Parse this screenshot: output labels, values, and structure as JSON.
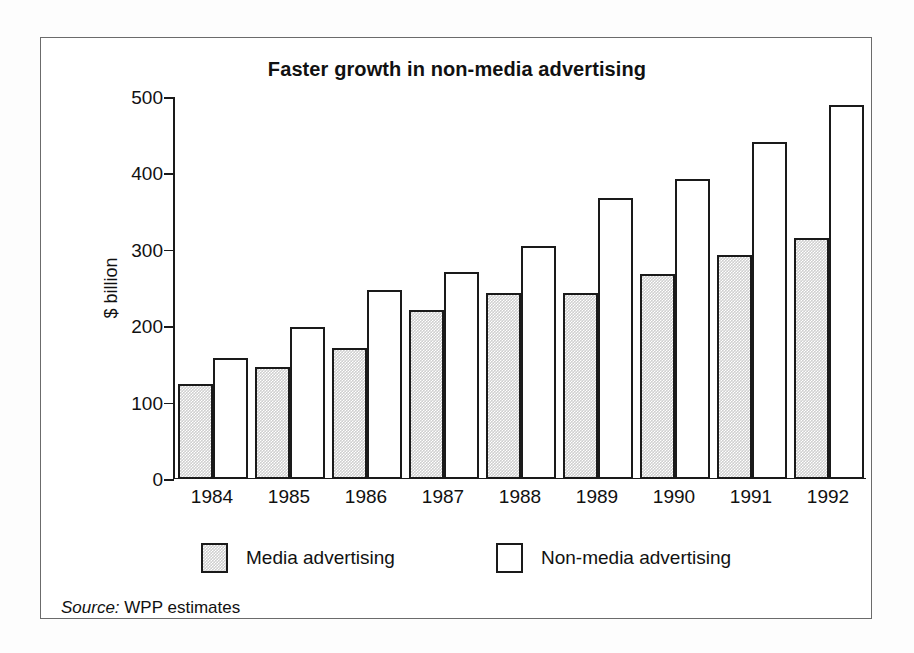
{
  "figure": {
    "title": "Faster growth in non-media advertising",
    "source_prefix": "Source:",
    "source_text": "WPP estimates"
  },
  "legend": {
    "media_label": "Media advertising",
    "nonmedia_label": "Non-media advertising"
  },
  "axis": {
    "ylabel": "$ billion",
    "yticks": [
      "0",
      "100",
      "200",
      "300",
      "400",
      "500"
    ]
  },
  "chart_data": {
    "type": "bar",
    "title": "Faster growth in non-media advertising",
    "xlabel": "",
    "ylabel": "$ billion",
    "ylim": [
      0,
      500
    ],
    "ytick_values": [
      0,
      100,
      200,
      300,
      400,
      500
    ],
    "grid": false,
    "legend_position": "bottom",
    "categories": [
      "1984",
      "1985",
      "1986",
      "1987",
      "1988",
      "1989",
      "1990",
      "1991",
      "1992"
    ],
    "series": [
      {
        "name": "Media advertising",
        "color": "#cfcfcf",
        "values": [
          125,
          147,
          172,
          221,
          244,
          243,
          268,
          293,
          315
        ]
      },
      {
        "name": "Non-media advertising",
        "color": "#ffffff",
        "values": [
          158,
          199,
          247,
          271,
          305,
          368,
          393,
          441,
          490
        ]
      }
    ],
    "annotations": [
      "Source: WPP estimates"
    ]
  }
}
